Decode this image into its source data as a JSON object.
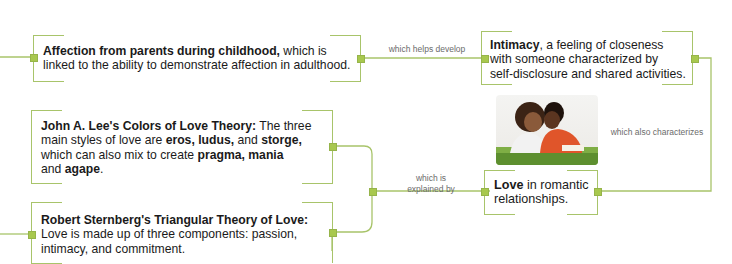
{
  "colors": {
    "connector": "#a8c46a",
    "node": "#a8c84e",
    "text": "#1a1a1a",
    "label_text": "#6b6b6b"
  },
  "nodes": {
    "affection": {
      "bold": "Affection from parents during childhood,",
      "rest1": " which is",
      "rest2": "linked to the ability to demonstrate affection in adulthood."
    },
    "intimacy": {
      "bold": "Intimacy",
      "rest1": ", a feeling of closeness",
      "rest2": "with someone characterized by",
      "rest3": "self-disclosure and shared activities."
    },
    "lee": {
      "bold1": "John A. Lee's Colors of Love Theory:",
      "t1": " The three",
      "t2": "main styles of love are ",
      "bold2": "eros, ludus,",
      "t3": " and ",
      "bold3": "storge,",
      "t4": "which can also mix to create ",
      "bold4": "pragma, mania",
      "t5": "and ",
      "bold5": "agape",
      "t6": "."
    },
    "sternberg": {
      "bold": "Robert Sternberg's Triangular Theory of Love:",
      "rest1": "Love is made up of three components: passion,",
      "rest2": "intimacy, and commitment."
    },
    "love": {
      "bold": "Love",
      "rest1": " in romantic",
      "rest2": "relationships."
    }
  },
  "edges": {
    "helps_develop": "which helps develop",
    "also_characterizes": "which also characterizes",
    "explained_by_1": "which is",
    "explained_by_2": "explained by"
  },
  "image": {
    "icon": "couple-photo-icon"
  }
}
